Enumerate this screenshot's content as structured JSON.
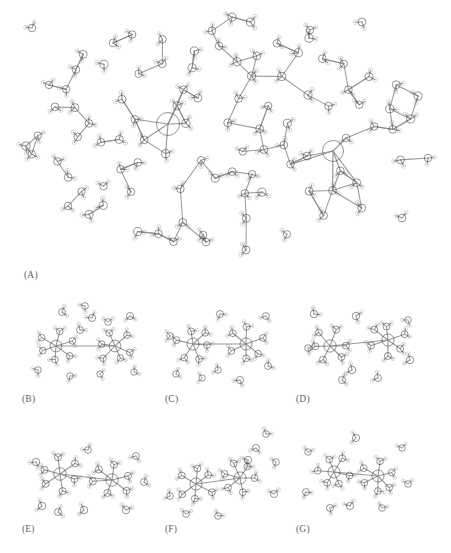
{
  "figure": {
    "type": "molecular-structure-figure",
    "rendering": "ball-and-stick grayscale",
    "background_color": "#ffffff",
    "width": 451,
    "height": 553,
    "palette": {
      "cation_color": "#1b1b1b",
      "oxygen_color": "#4d4d4d",
      "hydrogen_color": "#c9c9c9",
      "bond_color": "#8a8a8a",
      "label_color": "#5e5e5e"
    }
  },
  "panels": [
    {
      "id": "A",
      "label": "(A)",
      "label_x": 24,
      "label_y": 270,
      "x": 10,
      "y": 6,
      "width": 435,
      "height": 258,
      "description": "Large hydrated cluster with two dark cations surrounded by many water molecules",
      "cation_count": 2,
      "water_count": 96
    },
    {
      "id": "B",
      "label": "(B)",
      "label_x": 22,
      "label_y": 394,
      "x": 22,
      "y": 296,
      "width": 124,
      "height": 92,
      "description": "Two solvated cations with surrounding water shell",
      "cation_count": 2,
      "water_count": 24
    },
    {
      "id": "C",
      "label": "(C)",
      "label_x": 165,
      "label_y": 394,
      "x": 156,
      "y": 296,
      "width": 124,
      "height": 92,
      "description": "Two solvated cations, octahedral coordination",
      "cation_count": 2,
      "water_count": 22
    },
    {
      "id": "D",
      "label": "(D)",
      "label_x": 296,
      "label_y": 394,
      "x": 290,
      "y": 296,
      "width": 134,
      "height": 92,
      "description": "Two solvated cations with bridging water molecules",
      "cation_count": 2,
      "water_count": 22
    },
    {
      "id": "E",
      "label": "(E)",
      "label_x": 22,
      "label_y": 524,
      "x": 22,
      "y": 422,
      "width": 134,
      "height": 100,
      "description": "Two solvated cations, extended water network",
      "cation_count": 2,
      "water_count": 24
    },
    {
      "id": "F",
      "label": "(F)",
      "label_x": 165,
      "label_y": 524,
      "x": 156,
      "y": 422,
      "width": 134,
      "height": 104,
      "description": "Two solvated cations with a diagonal water chain",
      "cation_count": 2,
      "water_count": 22
    },
    {
      "id": "G",
      "label": "(G)",
      "label_x": 296,
      "label_y": 524,
      "x": 290,
      "y": 422,
      "width": 134,
      "height": 100,
      "description": "Two closely paired solvated cations",
      "cation_count": 2,
      "water_count": 20
    }
  ]
}
